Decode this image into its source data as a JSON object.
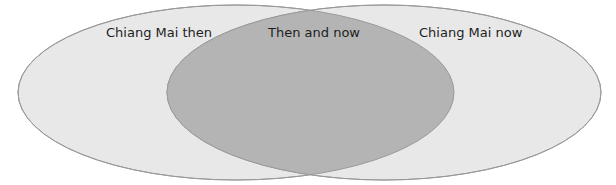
{
  "diagram": {
    "type": "venn",
    "sets": [
      {
        "id": "left",
        "label": "Chiang Mai then",
        "ellipse": {
          "cx": 236,
          "cy": 92.5,
          "rx": 218,
          "ry": 87.5
        },
        "fill": "#e8e8e8"
      },
      {
        "id": "right",
        "label": "Chiang Mai now",
        "ellipse": {
          "cx": 384,
          "cy": 92.5,
          "rx": 217,
          "ry": 87.5
        },
        "fill": "#e8e8e8"
      }
    ],
    "intersection": {
      "label": "Then and now",
      "fill": "#b4b4b4"
    },
    "colors": {
      "background": "#ffffff",
      "set_fill": "#e8e8e8",
      "overlap_fill": "#b4b4b4",
      "stroke": "#999999",
      "text": "#1e1e1e"
    }
  }
}
